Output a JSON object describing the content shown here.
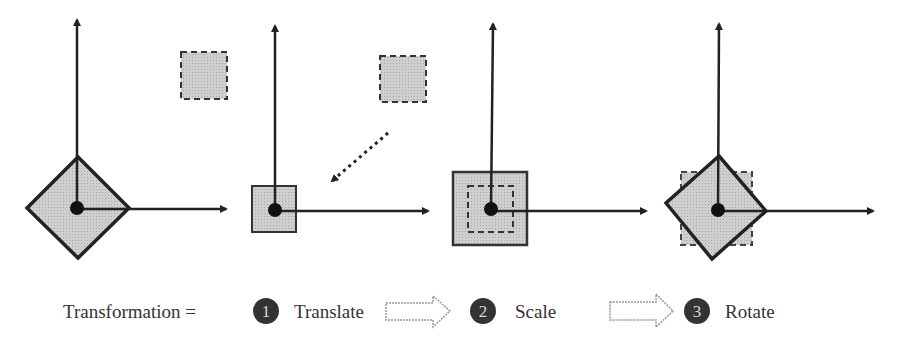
{
  "diagram": {
    "equation_label": "Transformation =",
    "steps": [
      {
        "number": "1",
        "label": "Translate"
      },
      {
        "number": "2",
        "label": "Scale"
      },
      {
        "number": "3",
        "label": "Rotate"
      }
    ],
    "panels": [
      {
        "name": "original",
        "description": "Square rotated 45° at origin with dashed source square offset"
      },
      {
        "name": "translate",
        "description": "Small square at origin; dotted arrow from dashed source square"
      },
      {
        "name": "scale",
        "description": "Enlarged square with dashed original-size square inside"
      },
      {
        "name": "rotate",
        "description": "Rotated square with dashed unrotated square behind"
      }
    ],
    "colors": {
      "shape_fill": "#c8c8c8",
      "stroke": "#222222",
      "badge_fill": "#333333",
      "text": "#333333"
    }
  }
}
